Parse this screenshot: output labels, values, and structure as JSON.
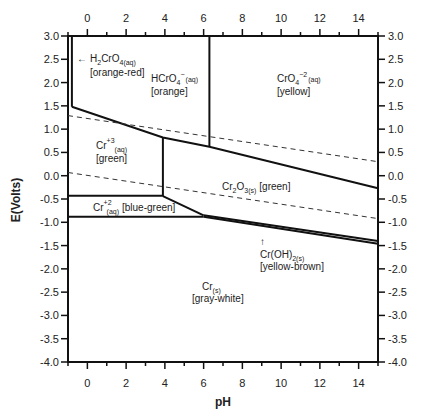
{
  "chart_data": {
    "type": "line",
    "title": "",
    "xlabel": "pH",
    "ylabel": "E(Volts)",
    "xlim": [
      -1,
      15
    ],
    "ylim": [
      -4.0,
      3.0
    ],
    "x_ticks": [
      0,
      2,
      4,
      6,
      8,
      10,
      12,
      14
    ],
    "x_tick_labels": [
      "0",
      "2",
      "4",
      "6",
      "8",
      "10",
      "12",
      "14"
    ],
    "y_ticks": [
      3.0,
      2.5,
      2.0,
      1.5,
      1.0,
      0.5,
      0.0,
      -0.5,
      -1.0,
      -1.5,
      -2.0,
      -2.5,
      -3.0,
      -3.5,
      -4.0
    ],
    "y_tick_labels": [
      "3.0",
      "2.5",
      "2.0",
      "1.5",
      "1.0",
      "0.5",
      "0.0",
      "-0.5",
      "-1.0",
      "-1.5",
      "-2.0",
      "-2.5",
      "-3.0",
      "-3.5",
      "-4.0"
    ],
    "grid": false,
    "mirror_axes": true,
    "boundaries": [
      {
        "name": "H2CrO4/HCrO4- vertical",
        "style": "solid",
        "points": [
          [
            -0.8,
            3.0
          ],
          [
            -0.8,
            1.48
          ]
        ]
      },
      {
        "name": "Cr(VI)/Cr(III) upper boundary",
        "style": "solid",
        "points": [
          [
            -0.8,
            1.48
          ],
          [
            3.9,
            0.82
          ],
          [
            6.3,
            0.62
          ],
          [
            15,
            -0.27
          ]
        ]
      },
      {
        "name": "HCrO4-/CrO4-2 vertical",
        "style": "solid",
        "points": [
          [
            6.3,
            3.0
          ],
          [
            6.3,
            0.62
          ]
        ]
      },
      {
        "name": "Cr+3/Cr2O3 vertical",
        "style": "solid",
        "points": [
          [
            3.9,
            0.82
          ],
          [
            3.9,
            -0.44
          ]
        ]
      },
      {
        "name": "Cr+3/Cr+2",
        "style": "solid",
        "points": [
          [
            -1,
            -0.43
          ],
          [
            3.9,
            -0.43
          ]
        ]
      },
      {
        "name": "Cr2O3/Cr+2",
        "style": "solid",
        "points": [
          [
            3.9,
            -0.44
          ],
          [
            6.0,
            -0.85
          ]
        ]
      },
      {
        "name": "Cr+2/Cr",
        "style": "solid",
        "points": [
          [
            -1,
            -0.88
          ],
          [
            6.0,
            -0.88
          ]
        ]
      },
      {
        "name": "Cr2O3/Cr(OH)2 upper",
        "style": "solid",
        "points": [
          [
            6.0,
            -0.85
          ],
          [
            15,
            -1.4
          ]
        ]
      },
      {
        "name": "Cr(OH)2/Cr lower",
        "style": "solid",
        "points": [
          [
            6.0,
            -0.88
          ],
          [
            15,
            -1.46
          ]
        ]
      },
      {
        "name": "O2/H2O water line",
        "style": "dashed",
        "points": [
          [
            -1,
            1.29
          ],
          [
            15,
            0.3
          ]
        ]
      },
      {
        "name": "H+/H2 water line",
        "style": "dashed",
        "points": [
          [
            -1,
            0.07
          ],
          [
            15,
            -0.92
          ]
        ]
      }
    ],
    "annotations": [
      {
        "text": "← H2CrO4(aq)",
        "sub": "4(aq)",
        "x": 0.0,
        "y": 2.5
      },
      {
        "text": "[orange-red]",
        "x": 0.2,
        "y": 2.18
      },
      {
        "text": "HCrO4⁻(aq)",
        "x": 3.3,
        "y": 2.05
      },
      {
        "text": "[orange]",
        "x": 3.3,
        "y": 1.8
      },
      {
        "text": "CrO4⁻²(aq)",
        "x": 9.6,
        "y": 2.05
      },
      {
        "text": "[yellow]",
        "x": 9.6,
        "y": 1.8
      },
      {
        "text": "Cr⁺³(aq)",
        "x": 0.6,
        "y": 0.55
      },
      {
        "text": "[green]",
        "x": 0.6,
        "y": 0.3
      },
      {
        "text": "Cr2O3(s) [green]",
        "x": 8.5,
        "y": -0.15
      },
      {
        "text": "Cr⁺²(aq) [blue-green]",
        "x": 1.3,
        "y": -0.65
      },
      {
        "text": "↑",
        "x": 9.0,
        "y": -1.42
      },
      {
        "text": "Cr(OH)2(s)",
        "x": 9.3,
        "y": -1.7
      },
      {
        "text": "[yellow-brown]",
        "x": 9.5,
        "y": -1.95
      },
      {
        "text": "Cr(s)",
        "x": 6.3,
        "y": -2.35
      },
      {
        "text": "[gray-white]",
        "x": 6.3,
        "y": -2.6
      }
    ]
  },
  "labels": {
    "xlabel": "pH",
    "ylabel": "E(Volts)",
    "h2cro4": {
      "arrow": "←",
      "main": "H",
      "sub1": "2",
      "mid": "CrO",
      "sub2": "4(aq)",
      "color": "[orange-red]"
    },
    "hcro4": {
      "main": "HCrO",
      "sub": "4",
      "sup": "−",
      "phase": "(aq)",
      "color": "[orange]"
    },
    "cro4": {
      "main": "CrO",
      "sub": "4",
      "sup": "−2",
      "phase": "(aq)",
      "color": "[yellow]"
    },
    "cr3": {
      "main": "Cr",
      "sup": "+3",
      "phase": "(aq)",
      "color": "[green]"
    },
    "cr2o3": {
      "main1": "Cr",
      "sub1": "2",
      "main2": "O",
      "sub2": "3(s)",
      "color": "[green]"
    },
    "cr2": {
      "main": "Cr",
      "sup": "+2",
      "phase": "(aq)",
      "color": "[blue-green]"
    },
    "croh2": {
      "arrow": "↑",
      "main": "Cr(OH)",
      "sub": "2(s)",
      "color": "[yellow-brown]"
    },
    "cr": {
      "main": "Cr",
      "sub": "(s)",
      "color": "[gray-white]"
    }
  }
}
